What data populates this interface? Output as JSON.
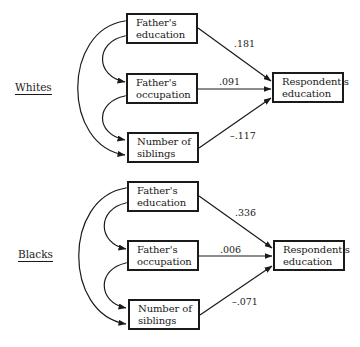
{
  "diagram": {
    "type": "path-diagram",
    "panels": [
      {
        "group": "Whites",
        "predictors": [
          {
            "line1": "Father's",
            "line2": "education"
          },
          {
            "line1": "Father's",
            "line2": "occupation"
          },
          {
            "line1": "Number of",
            "line2": "siblings"
          }
        ],
        "outcome": {
          "line1": "Respondent's",
          "line2": "education"
        },
        "coefficients": [
          ".181",
          ".091",
          "–.117"
        ]
      },
      {
        "group": "Blacks",
        "predictors": [
          {
            "line1": "Father's",
            "line2": "education"
          },
          {
            "line1": "Father's",
            "line2": "occupation"
          },
          {
            "line1": "Number of",
            "line2": "siblings"
          }
        ],
        "outcome": {
          "line1": "Respondent's",
          "line2": "education"
        },
        "coefficients": [
          ".336",
          ".006",
          "–.071"
        ]
      }
    ]
  }
}
